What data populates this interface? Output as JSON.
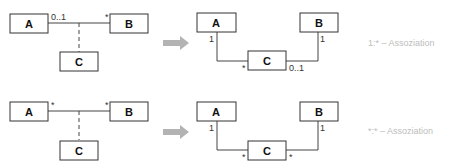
{
  "diagram": {
    "rows": [
      {
        "id": "one-to-many",
        "before": {
          "classes": [
            "A",
            "B",
            "C"
          ],
          "mult_a": "0..1",
          "mult_b": "*"
        },
        "after": {
          "classes": [
            "A",
            "B",
            "C"
          ],
          "mult_a_end": "1",
          "mult_b_end": "1",
          "mult_c_left": "*",
          "mult_c_right": "0..1"
        },
        "note": "1:* – Assoziation"
      },
      {
        "id": "many-to-many",
        "before": {
          "classes": [
            "A",
            "B",
            "C"
          ],
          "mult_a": "*",
          "mult_b": "*"
        },
        "after": {
          "classes": [
            "A",
            "B",
            "C"
          ],
          "mult_a_end": "1",
          "mult_b_end": "1",
          "mult_c_left": "*",
          "mult_c_right": "*"
        },
        "note": "*:* – Assoziation"
      }
    ],
    "arrow_icon": "right-arrow-icon",
    "colors": {
      "line": "#444444",
      "box_stroke": "#333333",
      "arrow": "#b3b3b3",
      "note": "#bdbdbd"
    }
  }
}
